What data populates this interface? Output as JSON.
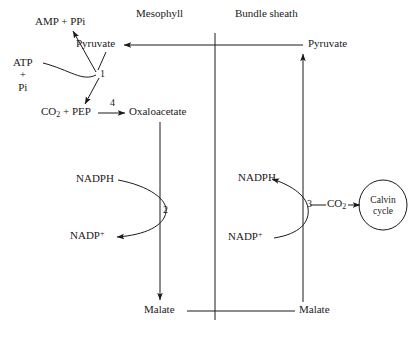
{
  "diagram": {
    "compartments": [
      {
        "name": "mesophyll",
        "label": "Mesophyll"
      },
      {
        "name": "bundle-sheath",
        "label": "Bundle sheath"
      }
    ],
    "metabolites": {
      "amp_ppi": "AMP + PPi",
      "atp": "ATP",
      "plus": "+",
      "pi": "Pi",
      "pyruvate_mesophyll": "Pyruvate",
      "pyruvate_bundle": "Pyruvate",
      "co2_pep": "CO",
      "co2_pep_sub": "2",
      "co2_pep_rest": " + PEP",
      "oxaloacetate": "Oxaloacetate",
      "nadph_mesophyll": "NADPH",
      "nadp_plus_mesophyll": "NADP",
      "nadp_plus_mesophyll_sup": "+",
      "nadph_bundle": "NADPH",
      "nadp_plus_bundle": "NADP",
      "nadp_plus_bundle_sup": "+",
      "malate_mesophyll": "Malate",
      "malate_bundle": "Malate",
      "co2_calvin": "CO",
      "co2_calvin_sub": "2"
    },
    "calvin_cycle": {
      "line1": "Calvin",
      "line2": "cycle"
    },
    "enzymes": [
      {
        "id": "1",
        "label": "1",
        "name": "pyruvate-phosphate-dikinase"
      },
      {
        "id": "2",
        "label": "2",
        "name": "nadp-malate-dehydrogenase"
      },
      {
        "id": "3",
        "label": "3",
        "name": "nadp-malic-enzyme"
      },
      {
        "id": "4",
        "label": "4",
        "name": "pep-carboxylase"
      }
    ],
    "colors": {
      "stroke": "#1a1a1a",
      "divider": "#1a1a1a",
      "background": "#ffffff",
      "text": "#1a1a1a"
    }
  }
}
